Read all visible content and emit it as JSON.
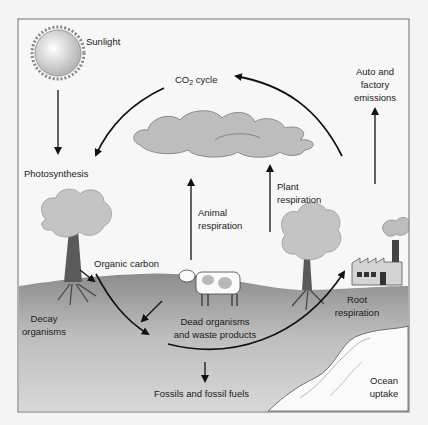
{
  "diagram": {
    "labels": {
      "sunlight": "Sunlight",
      "co2_cycle_prefix": "CO",
      "co2_cycle_sub": "2",
      "co2_cycle_suffix": " cycle",
      "auto_line1": "Auto and",
      "auto_line2": "factory",
      "auto_line3": "emissions",
      "photosynthesis": "Photosynthesis",
      "animal_line1": "Animal",
      "animal_line2": "respiration",
      "plant_line1": "Plant",
      "plant_line2": "respiration",
      "organic_carbon": "Organic carbon",
      "decay_line1": "Decay",
      "decay_line2": "organisms",
      "dead_line1": "Dead organisms",
      "dead_line2": "and waste products",
      "root_line1": "Root",
      "root_line2": "respiration",
      "fossils": "Fossils and fossil fuels",
      "ocean_line1": "Ocean",
      "ocean_line2": "uptake"
    },
    "colors": {
      "background": "#f4f4f4",
      "ground_top": "#8a8a8a",
      "ground_bottom": "#d4d4d4",
      "cloud": "#bdbdbd",
      "foliage": "#c4c4c4",
      "trunk": "#5a5a5a",
      "arrow": "#111111",
      "frame": "#6e6e6e"
    }
  }
}
